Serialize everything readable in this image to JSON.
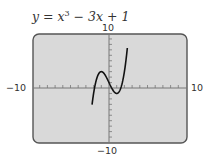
{
  "title": {
    "prefix": "y = x",
    "exp": "3",
    "suffix": " − 3x + 1"
  },
  "labels": {
    "ymax": "10",
    "ymin": "−10",
    "xmin": "−10",
    "xmax": "10"
  },
  "colors": {
    "screen": "#d9d9d9",
    "border": "#555555",
    "curve": "#111111",
    "axis": "#777777"
  },
  "chart_data": {
    "type": "line",
    "xlabel": "",
    "ylabel": "",
    "xlim": [
      -10,
      10
    ],
    "ylim": [
      -10,
      10
    ],
    "x_tick_step": 1,
    "y_tick_step": 1,
    "grid": false,
    "function": "x^3 - 3x + 1",
    "series": [
      {
        "name": "y = x^3 − 3x + 1",
        "x": [
          -2.11,
          -2.0,
          -1.5,
          -1.0,
          -0.5,
          0.0,
          0.5,
          1.0,
          1.5,
          2.0,
          2.33
        ],
        "values": [
          -10.0,
          -1.0,
          2.125,
          3.0,
          2.375,
          1.0,
          -0.375,
          -1.0,
          -0.125,
          3.0,
          10.0
        ]
      }
    ],
    "key_points": {
      "local_max": [
        -1,
        3
      ],
      "local_min": [
        1,
        -1
      ],
      "y_intercept": [
        0,
        1
      ]
    }
  }
}
